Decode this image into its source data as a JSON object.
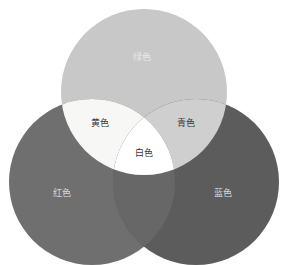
{
  "diagram": {
    "background_color": "#ffffff",
    "width": 288,
    "height": 265,
    "circles": [
      {
        "id": "green",
        "label": "绿色",
        "cx": 144,
        "cy": 92,
        "r": 83,
        "fill": "#c8c8c8",
        "label_x": 142,
        "label_y": 57,
        "label_color": "#e9e9e9"
      },
      {
        "id": "red",
        "label": "红色",
        "cx": 92,
        "cy": 182,
        "r": 83,
        "fill": "#6f6f6f",
        "label_x": 62,
        "label_y": 193,
        "label_color": "#d9d9d9"
      },
      {
        "id": "blue",
        "label": "蓝色",
        "cx": 196,
        "cy": 182,
        "r": 83,
        "fill": "#5c5c5c",
        "label_x": 223,
        "label_y": 193,
        "label_color": "#d9d9d9"
      }
    ],
    "overlaps": [
      {
        "id": "yellow",
        "label": "黄色",
        "parents": [
          "red",
          "green"
        ],
        "fill": "#f7f7f5",
        "label_x": 100,
        "label_y": 123,
        "label_color": "#3a3a3a"
      },
      {
        "id": "cyan",
        "label": "青色",
        "parents": [
          "green",
          "blue"
        ],
        "fill": "#cfcfcf",
        "label_x": 186,
        "label_y": 123,
        "label_color": "#3a3a3a"
      },
      {
        "id": "magenta",
        "label": "",
        "parents": [
          "red",
          "blue"
        ],
        "fill": "#676767",
        "label_x": 144,
        "label_y": 208,
        "label_color": "#d9d9d9"
      },
      {
        "id": "white",
        "label": "白色",
        "parents": [
          "red",
          "green",
          "blue"
        ],
        "fill": "#ffffff",
        "label_x": 144,
        "label_y": 153,
        "label_color": "#3a3a3a"
      }
    ]
  }
}
